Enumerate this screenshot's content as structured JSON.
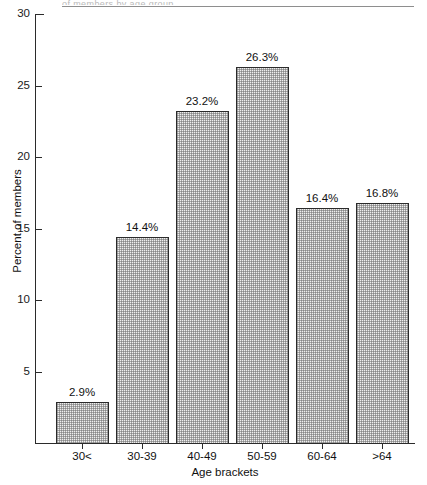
{
  "page": {
    "top_artifact_text": "of members by age group"
  },
  "chart_data": {
    "type": "bar",
    "title": "",
    "xlabel": "Age brackets",
    "ylabel": "Percent of members",
    "categories": [
      "30<",
      "30-39",
      "40-49",
      "50-59",
      "60-64",
      ">64"
    ],
    "values": [
      2.9,
      14.4,
      23.2,
      26.3,
      16.4,
      16.8
    ],
    "value_labels": [
      "2.9%",
      "14.4%",
      "23.2%",
      "26.3%",
      "16.4%",
      "16.8%"
    ],
    "ylim": [
      0,
      30
    ],
    "yticks": [
      5,
      10,
      15,
      20,
      25,
      30
    ],
    "ytick_labels": [
      "5",
      "10",
      "15",
      "20",
      "25",
      "30"
    ],
    "grid": false,
    "legend": "none",
    "bar_fill_color": "#efefef",
    "bar_edge_color": "#2b2b2b",
    "axis_color": "#2b2b2b"
  }
}
